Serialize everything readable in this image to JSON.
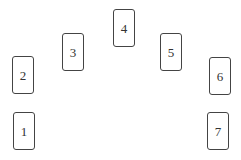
{
  "spread": {
    "cards": [
      {
        "label": "1",
        "x": 13,
        "y": 112
      },
      {
        "label": "2",
        "x": 12,
        "y": 56
      },
      {
        "label": "3",
        "x": 62,
        "y": 33
      },
      {
        "label": "4",
        "x": 113,
        "y": 9
      },
      {
        "label": "5",
        "x": 160,
        "y": 33
      },
      {
        "label": "6",
        "x": 209,
        "y": 57
      },
      {
        "label": "7",
        "x": 207,
        "y": 112
      }
    ]
  }
}
